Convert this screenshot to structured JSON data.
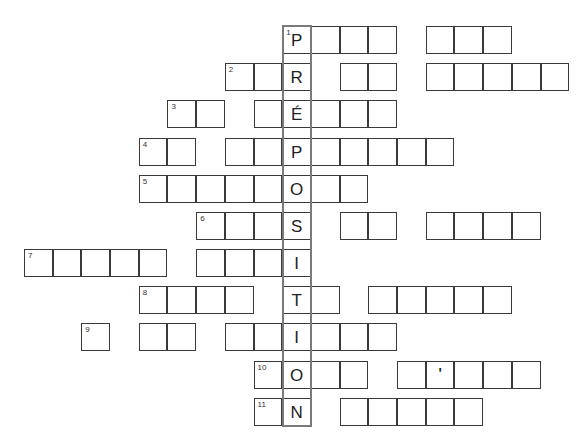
{
  "puzzle": {
    "title": "",
    "vertical_word": "PRÉPOSITION",
    "grid": {
      "origin_x": 24.7,
      "cell_w": 28.7,
      "cell_h": 28,
      "key_column": 9
    },
    "rows": [
      {
        "number": "1",
        "y": 26,
        "key_letter": "P",
        "groups": [
          [
            9,
            12
          ],
          [
            14,
            16
          ]
        ],
        "number_col": 9
      },
      {
        "number": "2",
        "y": 63,
        "key_letter": "R",
        "groups": [
          [
            7,
            9
          ],
          [
            11,
            12
          ],
          [
            14,
            18
          ]
        ],
        "number_col": 7
      },
      {
        "number": "3",
        "y": 100,
        "key_letter": "É",
        "groups": [
          [
            5,
            6
          ],
          [
            8,
            12
          ]
        ],
        "number_col": 5
      },
      {
        "number": "4",
        "y": 138,
        "key_letter": "P",
        "groups": [
          [
            4,
            5
          ],
          [
            7,
            8
          ],
          [
            9,
            14
          ]
        ],
        "number_col": 4
      },
      {
        "number": "5",
        "y": 175,
        "key_letter": "O",
        "groups": [
          [
            4,
            7
          ],
          [
            8,
            11
          ]
        ],
        "number_col": 4
      },
      {
        "number": "6",
        "y": 212,
        "key_letter": "S",
        "groups": [
          [
            6,
            9
          ],
          [
            11,
            12
          ],
          [
            14,
            17
          ]
        ],
        "number_col": 6
      },
      {
        "number": "7",
        "y": 249,
        "key_letter": "I",
        "groups": [
          [
            0,
            4
          ],
          [
            6,
            9
          ]
        ],
        "number_col": 0
      },
      {
        "number": "8",
        "y": 286,
        "key_letter": "T",
        "groups": [
          [
            4,
            7
          ],
          [
            9,
            10
          ],
          [
            12,
            16
          ]
        ],
        "number_col": 4
      },
      {
        "number": "9",
        "y": 323,
        "key_letter": "I",
        "groups": [
          [
            2,
            2
          ],
          [
            4,
            5
          ],
          [
            7,
            12
          ]
        ],
        "number_col": 2
      },
      {
        "number": "10",
        "y": 361,
        "key_letter": "O",
        "groups": [
          [
            8,
            11
          ],
          [
            13,
            17
          ]
        ],
        "number_col": 8,
        "apostrophe_col": 14
      },
      {
        "number": "11",
        "y": 398,
        "key_letter": "N",
        "groups": [
          [
            8,
            9
          ],
          [
            11,
            15
          ]
        ],
        "number_col": 8
      }
    ],
    "apostrophe": "'"
  }
}
